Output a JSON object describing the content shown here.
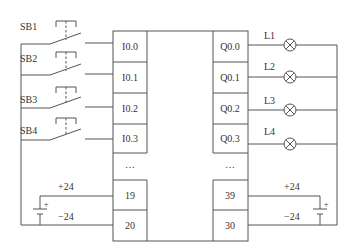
{
  "diagram": {
    "type": "PLC wiring diagram",
    "colors": {
      "line": "#555555",
      "text": "#333333",
      "background": "#ffffff"
    },
    "inputs": [
      {
        "switch": "SB1",
        "terminal": "I0.0"
      },
      {
        "switch": "SB2",
        "terminal": "I0.1"
      },
      {
        "switch": "SB3",
        "terminal": "I0.2"
      },
      {
        "switch": "SB4",
        "terminal": "I0.3"
      }
    ],
    "outputs": [
      {
        "terminal": "Q0.0",
        "lamp": "L1"
      },
      {
        "terminal": "Q0.1",
        "lamp": "L2"
      },
      {
        "terminal": "Q0.2",
        "lamp": "L3"
      },
      {
        "terminal": "Q0.3",
        "lamp": "L4"
      }
    ],
    "input_ellipsis": "…",
    "output_ellipsis": "…",
    "input_power": {
      "plus_terminal": "19",
      "minus_terminal": "20",
      "plus_label": "+24",
      "minus_label": "−24",
      "battery_plus": "+"
    },
    "output_power": {
      "plus_terminal": "39",
      "minus_terminal": "30",
      "plus_label": "+24",
      "minus_label": "−24",
      "battery_plus": "+"
    }
  }
}
